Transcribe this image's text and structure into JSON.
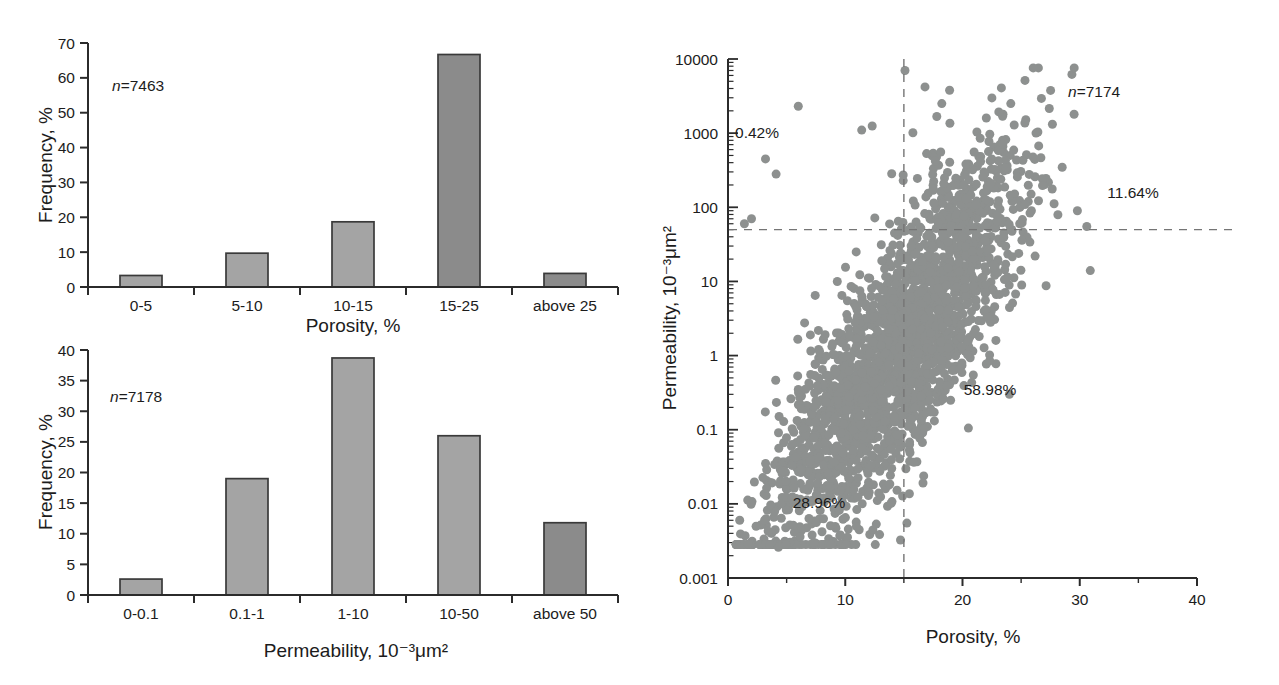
{
  "figure": {
    "background": "#ffffff",
    "text_color": "#1c1c1c",
    "axis_color": "#2b2b2b",
    "bar_fill_light": "#a4a4a4",
    "bar_fill_dark": "#8b8b8b",
    "bar_stroke": "#3a3a3a",
    "marker_color": "#8d908f",
    "dash_color": "#757575"
  },
  "chart_data": [
    {
      "id": "porosity_histogram",
      "type": "bar",
      "xlabel": "Porosity, %",
      "ylabel": "Frequency, %",
      "categories": [
        "0-5",
        "5-10",
        "10-15",
        "15-25",
        "above 25"
      ],
      "values": [
        3.3,
        9.7,
        18.7,
        66.7,
        3.9
      ],
      "ylim": [
        0,
        70
      ],
      "yticks": [
        0,
        10,
        20,
        30,
        40,
        50,
        60,
        70
      ],
      "grid": false,
      "n_italic": "n",
      "n_rest": "=7463",
      "bar_colors": [
        "#a4a4a4",
        "#a4a4a4",
        "#a4a4a4",
        "#8b8b8b",
        "#8b8b8b"
      ]
    },
    {
      "id": "permeability_histogram",
      "type": "bar",
      "xlabel": "Permeability, 10⁻³μm²",
      "ylabel": "Frequency, %",
      "categories": [
        "0-0.1",
        "0.1-1",
        "1-10",
        "10-50",
        "above 50"
      ],
      "values": [
        2.6,
        19.0,
        38.7,
        26.0,
        11.8
      ],
      "ylim": [
        0,
        40
      ],
      "yticks": [
        0,
        5,
        10,
        15,
        20,
        25,
        30,
        35,
        40
      ],
      "grid": false,
      "n_italic": "n",
      "n_rest": "=7178",
      "bar_colors": [
        "#a4a4a4",
        "#a4a4a4",
        "#a4a4a4",
        "#a4a4a4",
        "#8b8b8b"
      ]
    },
    {
      "id": "poroperm_scatter",
      "type": "scatter",
      "xlabel": "Porosity, %",
      "ylabel": "Permeability, 10⁻³μm²",
      "xlim": [
        0,
        40
      ],
      "xticks": [
        0,
        10,
        20,
        30,
        40
      ],
      "xminor_ticks": [
        5,
        15,
        25,
        35
      ],
      "ylog": true,
      "ylim_exponents": [
        -3,
        4
      ],
      "yticks": [
        "0.001",
        "0.01",
        "0.1",
        "1",
        "10",
        "100",
        "1000",
        "10000"
      ],
      "n_italic": "n",
      "n_rest": "=7174",
      "crosshair": {
        "porosity_cutoff": 15,
        "permeability_cutoff": 50,
        "line_style": "dashed"
      },
      "quadrant_labels": [
        {
          "text": "0.42%",
          "porosity": 2.3,
          "permeability": 1000,
          "quadrant": "top-left"
        },
        {
          "text": "11.64%",
          "porosity": 34.5,
          "permeability": 155,
          "quadrant": "top-right"
        },
        {
          "text": "58.98%",
          "porosity": 22.4,
          "permeability": 0.34,
          "quadrant": "bottom-right"
        },
        {
          "text": "28.96%",
          "porosity": 7.8,
          "permeability": 0.01,
          "quadrant": "bottom-left"
        }
      ],
      "cloud": {
        "n_points_depicted": 7174,
        "n_points_rendered": 2400,
        "mixture": [
          {
            "weight": 0.75,
            "porosity_mean": 16.5,
            "porosity_sd": 4.4
          },
          {
            "weight": 0.25,
            "porosity_mean": 8.0,
            "porosity_sd": 3.4
          }
        ],
        "porosity_range": [
          0.7,
          31.0
        ],
        "log10_perm_intercept": -2.9,
        "log10_perm_slope": 0.205,
        "log10_perm_noise_sd": 0.8,
        "log10_perm_range": [
          -2.55,
          3.88
        ],
        "marker_radius": 4.5,
        "outliers": [
          [
            6.0,
            2300
          ],
          [
            15.1,
            7000
          ],
          [
            12.3,
            1250
          ],
          [
            11.4,
            1100
          ],
          [
            16.8,
            4200
          ],
          [
            18.9,
            3800
          ],
          [
            2.0,
            70
          ],
          [
            1.4,
            60
          ],
          [
            3.2,
            450
          ],
          [
            4.1,
            280
          ],
          [
            30.6,
            55
          ],
          [
            30.9,
            14
          ],
          [
            29.8,
            90
          ],
          [
            7.3,
            0.003
          ],
          [
            4.3,
            0.0026
          ],
          [
            20.5,
            0.105
          ],
          [
            24.0,
            0.3
          ],
          [
            1.0,
            0.006
          ],
          [
            2.4,
            0.005
          ]
        ]
      }
    }
  ]
}
